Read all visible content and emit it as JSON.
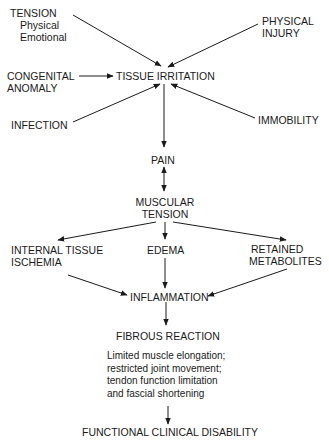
{
  "diagram": {
    "nodes": {
      "tension": {
        "label": "TENSION",
        "sub1": "Physical",
        "sub2": "Emotional"
      },
      "physical_injury": {
        "line1": "PHYSICAL",
        "line2": "INJURY"
      },
      "congenital_anomaly": {
        "line1": "CONGENITAL",
        "line2": "ANOMALY"
      },
      "tissue_irritation": {
        "label": "TISSUE IRRITATION"
      },
      "infection": {
        "label": "INFECTION"
      },
      "immobility": {
        "label": "IMMOBILITY"
      },
      "pain": {
        "label": "PAIN"
      },
      "muscular_tension": {
        "line1": "MUSCULAR",
        "line2": "TENSION"
      },
      "internal_tissue_ischemia": {
        "line1": "INTERNAL TISSUE",
        "line2": "ISCHEMIA"
      },
      "edema": {
        "label": "EDEMA"
      },
      "retained_metabolites": {
        "line1": "RETAINED",
        "line2": "METABOLITES"
      },
      "inflammation": {
        "label": "INFLAMMATION"
      },
      "fibrous_reaction": {
        "label": "FIBROUS REACTION"
      },
      "consequences": {
        "line1": "Limited muscle elongation;",
        "line2": "restricted joint movement;",
        "line3": "tendon function limitation",
        "line4": "and fascial shortening"
      },
      "functional_clinical_disability": {
        "label": "FUNCTIONAL CLINICAL DISABILITY"
      }
    },
    "edges": [
      {
        "from": "tension",
        "to": "tissue_irritation"
      },
      {
        "from": "physical_injury",
        "to": "tissue_irritation"
      },
      {
        "from": "congenital_anomaly",
        "to": "tissue_irritation"
      },
      {
        "from": "infection",
        "to": "tissue_irritation"
      },
      {
        "from": "immobility",
        "to": "tissue_irritation"
      },
      {
        "from": "tissue_irritation",
        "to": "pain"
      },
      {
        "from": "pain",
        "to": "muscular_tension",
        "bidirectional": true
      },
      {
        "from": "muscular_tension",
        "to": "internal_tissue_ischemia"
      },
      {
        "from": "muscular_tension",
        "to": "edema"
      },
      {
        "from": "muscular_tension",
        "to": "retained_metabolites"
      },
      {
        "from": "internal_tissue_ischemia",
        "to": "inflammation"
      },
      {
        "from": "edema",
        "to": "inflammation"
      },
      {
        "from": "retained_metabolites",
        "to": "inflammation"
      },
      {
        "from": "inflammation",
        "to": "fibrous_reaction"
      },
      {
        "from": "consequences",
        "to": "functional_clinical_disability"
      }
    ]
  }
}
